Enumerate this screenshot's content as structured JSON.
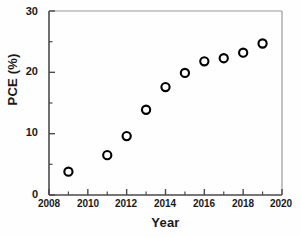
{
  "chart_data": {
    "type": "scatter",
    "title": "",
    "xlabel": "Year",
    "ylabel": "PCE (%)",
    "xlim": [
      2008,
      2020
    ],
    "ylim": [
      0,
      30
    ],
    "xticks": [
      2008,
      2010,
      2012,
      2014,
      2016,
      2018,
      2020
    ],
    "xtick_labels": [
      "2008",
      "2010",
      "2012",
      "2014",
      "2016",
      "2018",
      "2020"
    ],
    "xminor_ticks": [
      2009,
      2011,
      2013,
      2015,
      2017,
      2019
    ],
    "yticks": [
      0,
      10,
      20,
      30
    ],
    "ytick_labels": [
      "0",
      "10",
      "20",
      "30"
    ],
    "yminor_ticks": [
      5,
      15,
      25
    ],
    "grid": false,
    "legend": "none",
    "marker": "open-circle",
    "marker_color": "#000000",
    "marker_fill": "#ffffff",
    "x": [
      2009,
      2011,
      2012,
      2013,
      2014,
      2015,
      2016,
      2017,
      2018,
      2019
    ],
    "values": [
      3.8,
      6.5,
      9.6,
      13.9,
      17.6,
      19.9,
      21.8,
      22.3,
      23.2,
      24.7
    ],
    "series": [
      {
        "name": "PCE",
        "points": [
          {
            "x": 2009,
            "y": 3.8
          },
          {
            "x": 2011,
            "y": 6.5
          },
          {
            "x": 2012,
            "y": 9.6
          },
          {
            "x": 2013,
            "y": 13.9
          },
          {
            "x": 2014,
            "y": 17.6
          },
          {
            "x": 2015,
            "y": 19.9
          },
          {
            "x": 2016,
            "y": 21.8
          },
          {
            "x": 2017,
            "y": 22.3
          },
          {
            "x": 2018,
            "y": 23.2
          },
          {
            "x": 2019,
            "y": 24.7
          }
        ]
      }
    ]
  },
  "axes": {
    "x_title": "Year",
    "y_title": "PCE (%)",
    "x_tick_labels": [
      "2008",
      "2010",
      "2012",
      "2014",
      "2016",
      "2018",
      "2020"
    ],
    "y_tick_labels": [
      "0",
      "10",
      "20",
      "30"
    ]
  },
  "colors": {
    "axis": "#4a4a4a",
    "text": "#1a1a1a",
    "marker": "#000000",
    "background": "#fefefe"
  }
}
